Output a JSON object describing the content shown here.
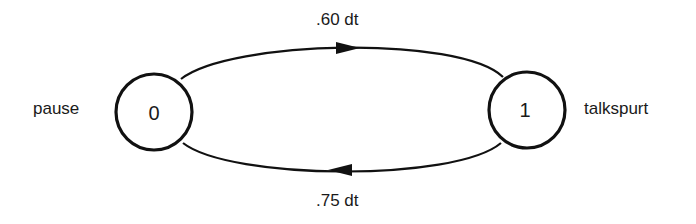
{
  "diagram": {
    "type": "state-transition",
    "states": [
      {
        "id": "0",
        "label": "0",
        "name": "pause"
      },
      {
        "id": "1",
        "label": "1",
        "name": "talkspurt"
      }
    ],
    "transitions": [
      {
        "from": "0",
        "to": "1",
        "label": ".60 dt",
        "position": "top"
      },
      {
        "from": "1",
        "to": "0",
        "label": ".75 dt",
        "position": "bottom"
      }
    ]
  },
  "colors": {
    "stroke": "#111111",
    "background": "#ffffff"
  }
}
